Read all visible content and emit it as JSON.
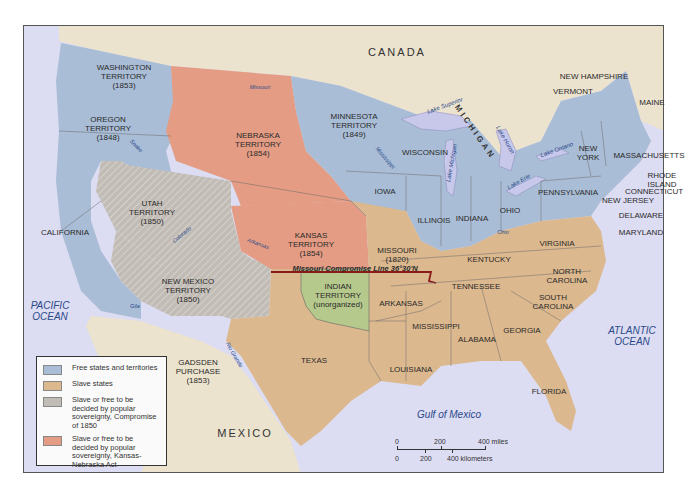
{
  "map": {
    "title": "Kansas-Nebraska Act map of the United States, 1854",
    "colors": {
      "free": "#a9bdd6",
      "slave": "#dcb88e",
      "compromise_1850": "#c2bcb6",
      "kansas_nebraska": "#e49c84",
      "indian_territory": "#b6c98c",
      "foreign_land": "#ece3cf",
      "water": "#dcdcf2",
      "missouri_line": "#8b1a1a"
    },
    "countries": {
      "canada": "CANADA",
      "mexico": "MEXICO"
    },
    "oceans": {
      "pacific": [
        "PACIFIC",
        "OCEAN"
      ],
      "atlantic": [
        "ATLANTIC",
        "OCEAN"
      ],
      "gulf": "Gulf of Mexico"
    },
    "lakes": {
      "superior": "Lake Superior",
      "michigan": "Lake Michigan",
      "huron": "Lake Huron",
      "erie": "Lake Erie",
      "ontario": "Lake Ontario"
    },
    "rivers": {
      "missouri": "Missouri",
      "snake": "Snake",
      "mississippi": "Mississippi",
      "colorado": "Colorado",
      "arkansas": "Arkansas",
      "gila": "Gila",
      "rio_grande": "Rio Grande",
      "ohio": "Ohio"
    },
    "missouri_compromise_line": "Missouri Compromise Line 36°30'N",
    "territories": {
      "washington": [
        "WASHINGTON",
        "TERRITORY",
        "(1853)"
      ],
      "oregon": [
        "OREGON",
        "TERRITORY",
        "(1848)"
      ],
      "nebraska": [
        "NEBRASKA",
        "TERRITORY",
        "(1854)"
      ],
      "minnesota": [
        "MINNESOTA",
        "TERRITORY",
        "(1849)"
      ],
      "utah": [
        "UTAH",
        "TERRITORY",
        "(1850)"
      ],
      "kansas": [
        "KANSAS",
        "TERRITORY",
        "(1854)"
      ],
      "new_mexico": [
        "NEW MEXICO",
        "TERRITORY",
        "(1850)"
      ],
      "indian": [
        "INDIAN",
        "TERRITORY",
        "(unorganized)"
      ],
      "gadsden": [
        "GADSDEN",
        "PURCHASE",
        "(1853)"
      ]
    },
    "states": {
      "california": "CALIFORNIA",
      "wisconsin": "WISCONSIN",
      "michigan": "MICHIGAN",
      "iowa": "IOWA",
      "illinois": "ILLINOIS",
      "indiana": "INDIANA",
      "ohio": "OHIO",
      "pennsylvania": "PENNSYLVANIA",
      "new_york": [
        "NEW",
        "YORK"
      ],
      "new_hampshire": "NEW HAMPSHIRE",
      "vermont": "VERMONT",
      "maine": "MAINE",
      "massachusetts": "MASSACHUSETTS",
      "rhode_island": [
        "RHODE",
        "ISLAND"
      ],
      "connecticut": "CONNECTICUT",
      "new_jersey": "NEW JERSEY",
      "delaware": "DELAWARE",
      "maryland": "MARYLAND",
      "missouri": [
        "MISSOURI",
        "(1820)"
      ],
      "kentucky": "KENTUCKY",
      "virginia": "VIRGINIA",
      "north_carolina": [
        "NORTH",
        "CAROLINA"
      ],
      "south_carolina": [
        "SOUTH",
        "CAROLINA"
      ],
      "tennessee": "TENNESSEE",
      "arkansas": "ARKANSAS",
      "mississippi": "MISSISSIPPI",
      "alabama": "ALABAMA",
      "georgia": "GEORGIA",
      "louisiana": "LOUISIANA",
      "texas": "TEXAS",
      "florida": "FLORIDA"
    }
  },
  "legend": {
    "items": [
      {
        "label": "Free states and territories",
        "color": "#a9bdd6"
      },
      {
        "label": "Slave states",
        "color": "#dcb88e"
      },
      {
        "label": "Slave or free to be decided by popular sovereignty, Compromise of 1850",
        "color": "#c2bcb6"
      },
      {
        "label": "Slave or free to be decided by popular sovereignty, Kansas-Nebraska Act",
        "color": "#e49c84"
      }
    ]
  },
  "scale": {
    "miles": [
      "0",
      "200",
      "400 miles"
    ],
    "kilometers": [
      "0",
      "200",
      "400 kilometers"
    ]
  }
}
